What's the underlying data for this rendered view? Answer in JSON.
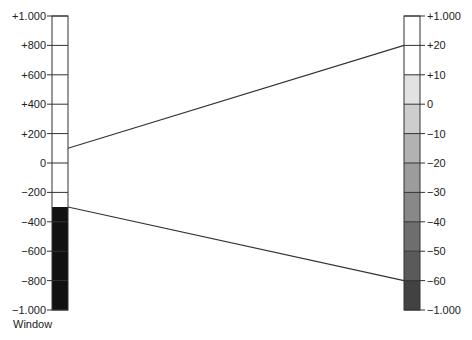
{
  "left_scale": {
    "caption": "Window",
    "ticks": [
      "+1.000",
      "+800",
      "+600",
      "+400",
      "+200",
      "0",
      "−200",
      "−400",
      "−600",
      "−800",
      "−1.000"
    ],
    "window_upper": "+100",
    "window_lower": "−300",
    "fill_below_window": "#111111",
    "fill_in_window": "#ffffff"
  },
  "right_scale": {
    "ticks": [
      "+1.000",
      "+20",
      "+10",
      "0",
      "−10",
      "−20",
      "−30",
      "−40",
      "−50",
      "−60",
      "−1.000"
    ],
    "segment_colors": [
      "#ffffff",
      "#ffffff",
      "#e2e2e2",
      "#cdcdcd",
      "#b2b2b2",
      "#9c9c9c",
      "#888888",
      "#6e6e6e",
      "#5a5a5a",
      "#424242"
    ]
  },
  "connectors": [
    {
      "from": "+100",
      "to": "+20"
    },
    {
      "from": "−300",
      "to": "−60"
    }
  ]
}
